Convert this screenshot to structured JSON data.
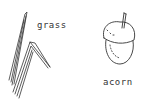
{
  "items": [
    {
      "label": "grass",
      "icon": "grass-icon"
    },
    {
      "label": "acorn",
      "icon": "acorn-icon"
    }
  ],
  "colors": {
    "ink": "#333333",
    "background": "#ffffff"
  }
}
